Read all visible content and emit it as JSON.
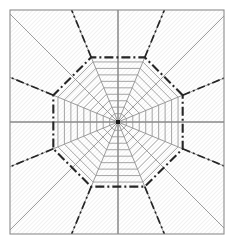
{
  "figure": {
    "kind": "radial-polar-mesh-diagram",
    "title": "",
    "canvas": {
      "width": 234,
      "height": 247,
      "background": "#ffffff"
    }
  },
  "chart_data": {
    "type": "diagram",
    "title": "",
    "subtitle": "",
    "xlabel": "",
    "ylabel": "",
    "legend": [],
    "annotations": [],
    "grid": true,
    "frame": {
      "x0": 10,
      "y0": 10,
      "x1": 224,
      "y1": 234,
      "stroke": "#8c8c8c",
      "stroke_width": 1.1,
      "fill": "#f4f4f4",
      "hatch": {
        "enabled": true,
        "angle_deg": 45,
        "spacing": 3,
        "stroke": "#d7d7d7",
        "stroke_width": 0.7
      }
    },
    "center": {
      "x": 118,
      "y": 122,
      "marker": "square",
      "marker_size": 4,
      "color": "#1a1a1a",
      "label": ""
    },
    "spokes": {
      "count": 16,
      "angles_deg": [
        0,
        22.5,
        45,
        67.5,
        90,
        112.5,
        135,
        157.5,
        180,
        202.5,
        225,
        247.5,
        270,
        292.5,
        315,
        337.5
      ],
      "stroke": "#8a8a8a",
      "stroke_width": 0.85,
      "extend_to_frame": true
    },
    "axes": {
      "horizontal": {
        "y": 122,
        "x0": 10,
        "x1": 224,
        "stroke": "#767676",
        "stroke_width": 0.9
      },
      "vertical": {
        "x": 118,
        "y0": 10,
        "y1": 234,
        "stroke": "#767676",
        "stroke_width": 0.9
      }
    },
    "rings": {
      "shape": "octagon",
      "count": 9,
      "radii": [
        9,
        16,
        23,
        30,
        37,
        44,
        51,
        58,
        65
      ],
      "stroke": "#8f8f8f",
      "stroke_width": 0.8,
      "fill": "none"
    },
    "highlight_ring": {
      "shape": "octagon",
      "radius": 70,
      "stroke": "#262626",
      "stroke_width": 2.1,
      "dash": "9,3,2,3",
      "label": ""
    },
    "highlight_rays": {
      "count": 8,
      "angles_deg": [
        22.5,
        67.5,
        112.5,
        157.5,
        202.5,
        247.5,
        292.5,
        337.5
      ],
      "from_radius": 70,
      "stroke": "#262626",
      "stroke_width": 1.7,
      "dash": "8,3,2,3",
      "extend_to_frame": true
    },
    "colors": {
      "frame_fill": "#f4f4f4",
      "frame_stroke": "#8c8c8c",
      "hatch": "#d7d7d7",
      "mesh": "#8a8a8a",
      "axis": "#767676",
      "highlight": "#262626",
      "center_node": "#1a1a1a",
      "background": "#ffffff"
    }
  }
}
